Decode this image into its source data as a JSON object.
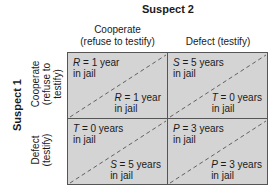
{
  "suspect2": {
    "title": "Suspect 2",
    "columns": [
      {
        "line1": "Cooperate",
        "line2": "(refuse to testify)"
      },
      {
        "line1": "Defect (testify)",
        "line2": ""
      }
    ]
  },
  "suspect1": {
    "title": "Suspect 1",
    "rows": [
      {
        "line1": "Cooperate",
        "line2": "(refuse to",
        "line3": "testify)"
      },
      {
        "line1": "Defect",
        "line2": "(testify)",
        "line3": ""
      }
    ]
  },
  "cells": [
    {
      "tl_sym": "R",
      "tl_val": " = 1 year",
      "tl_sub": "in jail",
      "br_sym": "R",
      "br_val": " = 1 year",
      "br_sub": "in jail"
    },
    {
      "tl_sym": "S",
      "tl_val": " = 5 years",
      "tl_sub": "in jail",
      "br_sym": "T",
      "br_val": " = 0 years",
      "br_sub": "in jail"
    },
    {
      "tl_sym": "T",
      "tl_val": " = 0 years",
      "tl_sub": "in jail",
      "br_sym": "S",
      "br_val": " = 5 years",
      "br_sub": "in jail"
    },
    {
      "tl_sym": "P",
      "tl_val": " = 3 years",
      "tl_sub": "in jail",
      "br_sym": "P",
      "br_val": " = 3 years",
      "br_sub": "in jail"
    }
  ]
}
